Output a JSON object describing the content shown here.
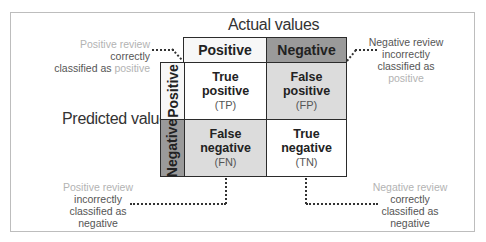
{
  "diagram": {
    "title_top_axis": "Actual values",
    "title_left_axis": "Predicted values",
    "columns": [
      {
        "label": "Positive",
        "fill": "#f7f7f7"
      },
      {
        "label": "Negative",
        "fill": "#9a9a9a"
      }
    ],
    "rows": [
      {
        "label": "Positive",
        "fill": "#f7f7f7"
      },
      {
        "label": "Negative",
        "fill": "#9a9a9a"
      }
    ],
    "cells": [
      {
        "line1": "True",
        "line2": "positive",
        "abbr": "(TP)",
        "fill": "#ffffff"
      },
      {
        "line1": "False",
        "line2": "positive",
        "abbr": "(FP)",
        "fill": "#dcdcdc"
      },
      {
        "line1": "False",
        "line2": "negative",
        "abbr": "(FN)",
        "fill": "#dcdcdc"
      },
      {
        "line1": "True",
        "line2": "negative",
        "abbr": "(TN)",
        "fill": "#ffffff"
      }
    ],
    "notes": {
      "tp": {
        "hl1": "Positive review",
        "mid": " correctly",
        "line2a": "classified as ",
        "hl2": "positive"
      },
      "fp": {
        "line1": "Negative review",
        "line2": "incorrectly",
        "line3": "classified as",
        "hl": "positive"
      },
      "fn": {
        "hl": "Positive review",
        "line2": "incorrectly",
        "line3": "classified as",
        "line4": "negative"
      },
      "tn": {
        "hl": "Negative review",
        "line2": "correctly",
        "line3": "classified as",
        "line4": "negative"
      }
    }
  }
}
